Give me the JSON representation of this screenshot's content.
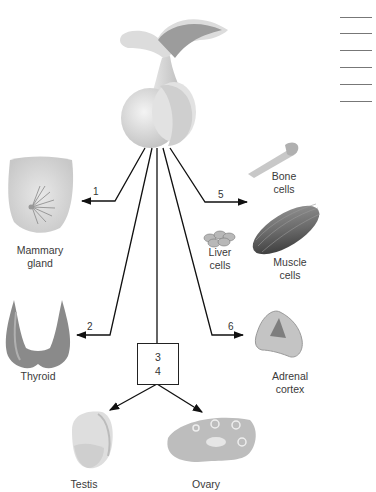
{
  "diagram": {
    "title_source": "Pituitary gland (anterior) hormone targets",
    "center_organ": "pituitary-gland",
    "answer_blanks_count": 6,
    "targets": [
      {
        "id": 1,
        "number": "1",
        "label": "Mammary gland",
        "line1": "Mammary",
        "line2": "gland"
      },
      {
        "id": 2,
        "number": "2",
        "label": "Thyroid",
        "line1": "Thyroid",
        "line2": ""
      },
      {
        "id": 3,
        "number": "3",
        "label": "Testis / Ovary"
      },
      {
        "id": 4,
        "number": "4",
        "label": "Testis / Ovary"
      },
      {
        "id": 5,
        "number": "5",
        "label": "Bone, Liver, Muscle cells"
      },
      {
        "id": 6,
        "number": "6",
        "label": "Adrenal cortex",
        "line1": "Adrenal",
        "line2": "cortex"
      }
    ],
    "cell_labels": {
      "bone": {
        "line1": "Bone",
        "line2": "cells"
      },
      "liver": {
        "line1": "Liver",
        "line2": "cells"
      },
      "muscle": {
        "line1": "Muscle",
        "line2": "cells"
      }
    },
    "gonads": {
      "testis": "Testis",
      "ovary": "Ovary"
    },
    "box_numbers": [
      "3",
      "4"
    ]
  }
}
